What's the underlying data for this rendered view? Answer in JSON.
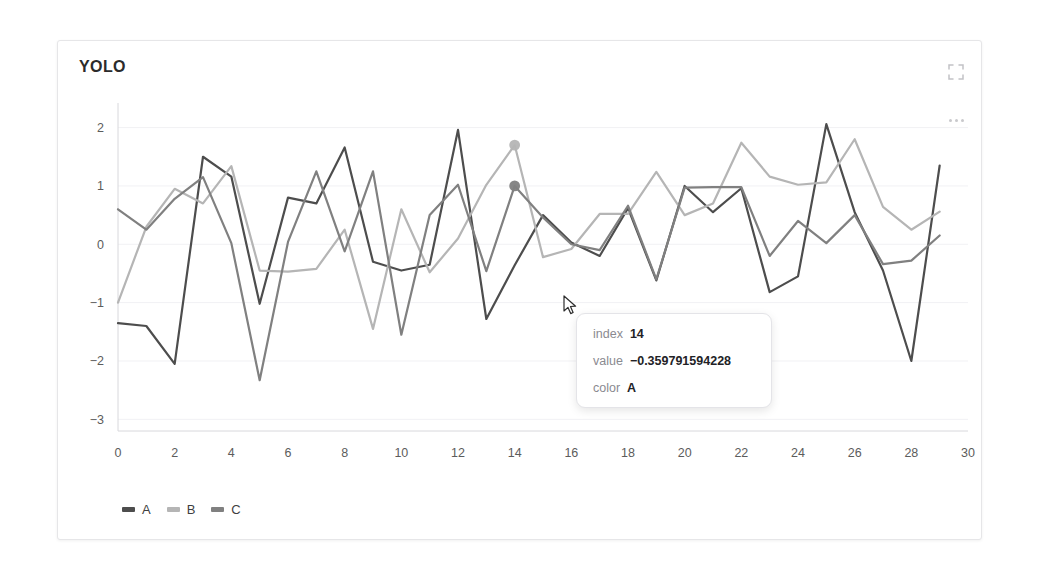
{
  "card": {
    "title": "YOLO",
    "expand_icon": "fullscreen-expand-icon",
    "more_icon": "more-horizontal-icon"
  },
  "legend": {
    "position": "bottom-left",
    "items": [
      {
        "label": "A",
        "color": "#4d4d4d"
      },
      {
        "label": "B",
        "color": "#b5b5b5"
      },
      {
        "label": "C",
        "color": "#808080"
      }
    ]
  },
  "tooltip": {
    "rows": [
      {
        "key": "index",
        "value": "14"
      },
      {
        "key": "value",
        "value": "−0.359791594228"
      },
      {
        "key": "color",
        "value": "A"
      }
    ]
  },
  "chart_data": {
    "type": "line",
    "title": "YOLO",
    "xlabel": "",
    "ylabel": "",
    "xlim": [
      0,
      30
    ],
    "ylim": [
      -3.2,
      2.25
    ],
    "xticks": [
      0,
      2,
      4,
      6,
      8,
      10,
      12,
      14,
      16,
      18,
      20,
      22,
      24,
      26,
      28,
      30
    ],
    "yticks": [
      2,
      1,
      0,
      -1,
      -2,
      -3
    ],
    "grid": true,
    "legend_position": "bottom-left",
    "x": [
      0,
      1,
      2,
      3,
      4,
      5,
      6,
      7,
      8,
      9,
      10,
      11,
      12,
      13,
      14,
      15,
      16,
      17,
      18,
      19,
      20,
      21,
      22,
      23,
      24,
      25,
      26,
      27,
      28,
      29
    ],
    "series": [
      {
        "name": "A",
        "color": "#4d4d4d",
        "values": [
          -1.35,
          -1.4,
          -2.05,
          1.5,
          1.16,
          -1.02,
          0.8,
          0.7,
          1.66,
          -0.3,
          -0.45,
          -0.35,
          1.96,
          -1.28,
          -0.36,
          0.5,
          0.03,
          -0.2,
          0.62,
          -0.62,
          1.0,
          0.55,
          0.96,
          -0.82,
          -0.55,
          2.06,
          0.55,
          -0.45,
          -2.0,
          1.35
        ]
      },
      {
        "name": "B",
        "color": "#b5b5b5",
        "values": [
          -1.0,
          0.3,
          0.95,
          0.7,
          1.34,
          -0.45,
          -0.47,
          -0.42,
          0.25,
          -1.45,
          0.6,
          -0.48,
          0.1,
          1.02,
          1.7,
          -0.22,
          -0.08,
          0.52,
          0.52,
          1.24,
          0.5,
          0.7,
          1.74,
          1.16,
          1.02,
          1.06,
          1.8,
          0.64,
          0.25,
          0.56
        ]
      },
      {
        "name": "C",
        "color": "#808080",
        "values": [
          0.6,
          0.25,
          0.78,
          1.15,
          0.02,
          -2.33,
          0.04,
          1.25,
          -0.12,
          1.25,
          -1.55,
          0.5,
          1.02,
          -0.46,
          1.0,
          0.46,
          0.0,
          -0.1,
          0.66,
          -0.6,
          0.97,
          0.98,
          0.98,
          -0.2,
          0.4,
          0.02,
          0.5,
          -0.34,
          -0.28,
          0.15
        ]
      }
    ],
    "highlight": {
      "index": 14,
      "points": [
        {
          "series": "B",
          "value": 1.7
        },
        {
          "series": "C",
          "value": 1.0
        },
        {
          "series": "A",
          "value": -0.36
        }
      ]
    }
  }
}
